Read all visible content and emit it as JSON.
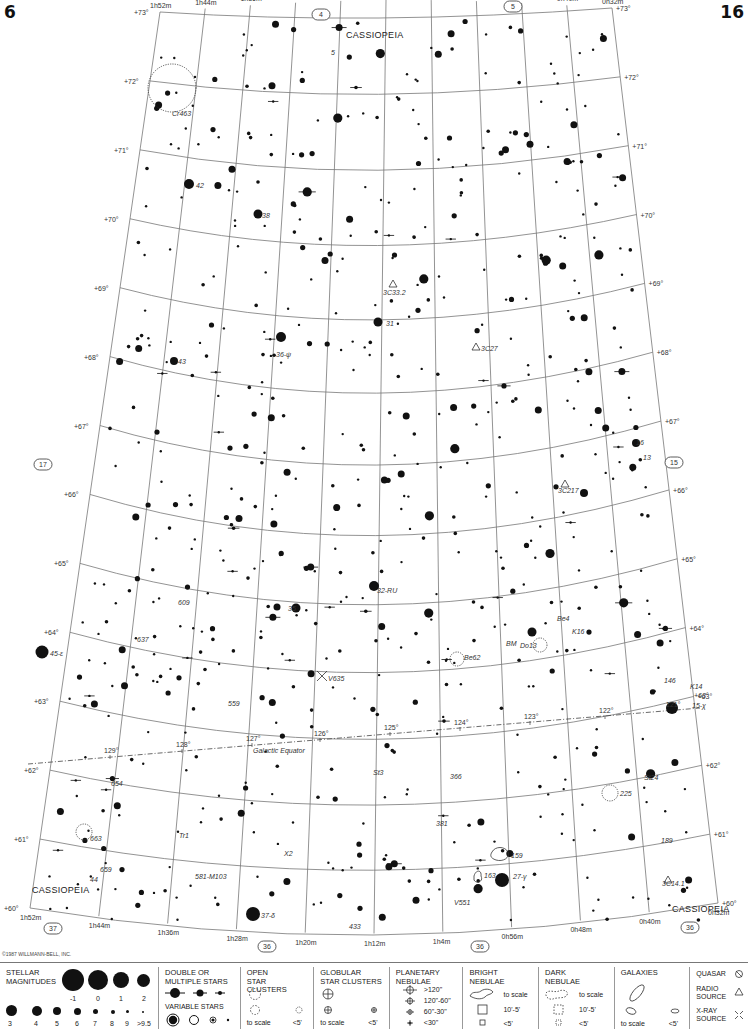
{
  "page": {
    "left_number": "6",
    "right_number": "16"
  },
  "constellation_labels": [
    {
      "text": "CASSIOPEIA",
      "x": 346,
      "y": 38
    },
    {
      "text": "CASSIOPEIA",
      "x": 32,
      "y": 893
    },
    {
      "text": "CASSIOPEIA",
      "x": 672,
      "y": 912
    }
  ],
  "ra_labels_top": [
    "1h52m",
    "1h44m",
    "1h36m",
    "1h28m",
    "1h20m",
    "1h12m",
    "1h4m",
    "0h56m",
    "0h48m",
    "0h40m",
    "0h32m"
  ],
  "ra_labels_bottom": [
    "1h52m",
    "1h44m",
    "1h36m",
    "1h28m",
    "1h20m",
    "1h12m",
    "1h4m",
    "0h56m",
    "0h48m",
    "0h40m",
    "0h32m"
  ],
  "dec_labels": [
    "+73°",
    "+72°",
    "+71°",
    "+70°",
    "+69°",
    "+68°",
    "+67°",
    "+66°",
    "+65°",
    "+64°",
    "+63°",
    "+62°",
    "+61°",
    "+60°"
  ],
  "adjacent_chart_refs": [
    {
      "text": "4",
      "x": 320,
      "y": 10
    },
    {
      "text": "5",
      "x": 512,
      "y": 2
    },
    {
      "text": "17",
      "x": 42,
      "y": 460
    },
    {
      "text": "15",
      "x": 673,
      "y": 458
    },
    {
      "text": "37",
      "x": 52,
      "y": 924
    },
    {
      "text": "36",
      "x": 266,
      "y": 942
    },
    {
      "text": "36",
      "x": 479,
      "y": 942
    },
    {
      "text": "36",
      "x": 689,
      "y": 923
    }
  ],
  "object_labels": [
    {
      "text": "Cr463",
      "x": 172,
      "y": 116
    },
    {
      "text": "5",
      "x": 331,
      "y": 55
    },
    {
      "text": "42",
      "x": 196,
      "y": 188
    },
    {
      "text": "38",
      "x": 262,
      "y": 218
    },
    {
      "text": "3C33.2",
      "x": 383,
      "y": 295
    },
    {
      "text": "3C27",
      "x": 481,
      "y": 351
    },
    {
      "text": "31",
      "x": 386,
      "y": 326
    },
    {
      "text": "36-ψ",
      "x": 276,
      "y": 357
    },
    {
      "text": "43",
      "x": 178,
      "y": 364
    },
    {
      "text": "16",
      "x": 636,
      "y": 445
    },
    {
      "text": "13",
      "x": 643,
      "y": 460
    },
    {
      "text": "3C217",
      "x": 558,
      "y": 493
    },
    {
      "text": "32-RU",
      "x": 377,
      "y": 593
    },
    {
      "text": "35",
      "x": 288,
      "y": 611
    },
    {
      "text": "609",
      "x": 178,
      "y": 605
    },
    {
      "text": "637",
      "x": 137,
      "y": 642
    },
    {
      "text": "Be4",
      "x": 557,
      "y": 621
    },
    {
      "text": "K16",
      "x": 572,
      "y": 634
    },
    {
      "text": "BM",
      "x": 506,
      "y": 646
    },
    {
      "text": "Do13",
      "x": 520,
      "y": 648
    },
    {
      "text": "45-ε",
      "x": 50,
      "y": 656
    },
    {
      "text": "Be62",
      "x": 464,
      "y": 660
    },
    {
      "text": "V635",
      "x": 328,
      "y": 681
    },
    {
      "text": "146",
      "x": 664,
      "y": 683
    },
    {
      "text": "K14",
      "x": 690,
      "y": 689
    },
    {
      "text": "+63°",
      "x": 694,
      "y": 698
    },
    {
      "text": "15-χ",
      "x": 692,
      "y": 708
    },
    {
      "text": "559",
      "x": 228,
      "y": 706
    },
    {
      "text": "Galactic Equator",
      "x": 253,
      "y": 753
    },
    {
      "text": "St3",
      "x": 373,
      "y": 775
    },
    {
      "text": "366",
      "x": 450,
      "y": 779
    },
    {
      "text": "St24",
      "x": 644,
      "y": 780
    },
    {
      "text": "654",
      "x": 111,
      "y": 786
    },
    {
      "text": "225",
      "x": 620,
      "y": 796
    },
    {
      "text": "381",
      "x": 436,
      "y": 826
    },
    {
      "text": "663",
      "x": 90,
      "y": 841
    },
    {
      "text": "Tr1",
      "x": 179,
      "y": 838
    },
    {
      "text": "189",
      "x": 661,
      "y": 843
    },
    {
      "text": "X2",
      "x": 284,
      "y": 856
    },
    {
      "text": "159",
      "x": 511,
      "y": 858
    },
    {
      "text": "163",
      "x": 484,
      "y": 878
    },
    {
      "text": "27-γ",
      "x": 513,
      "y": 879
    },
    {
      "text": "659",
      "x": 100,
      "y": 872
    },
    {
      "text": "44",
      "x": 90,
      "y": 882
    },
    {
      "text": "581-M103",
      "x": 195,
      "y": 879
    },
    {
      "text": "3C14.1",
      "x": 662,
      "y": 886
    },
    {
      "text": "V551",
      "x": 454,
      "y": 905
    },
    {
      "text": "37-δ",
      "x": 261,
      "y": 918
    },
    {
      "text": "433",
      "x": 349,
      "y": 929
    }
  ],
  "galactic_longitude_ticks": [
    "129°",
    "128°",
    "127°",
    "126°",
    "125°",
    "124°",
    "123°",
    "122°",
    "121°"
  ],
  "copyright": "©1987 WILLMANN-BELL, INC.",
  "legend": {
    "stellar_magnitudes": {
      "title_line1": "STELLAR",
      "title_line2": "MAGNITUDES",
      "row1": [
        "-1",
        "0",
        "1",
        "2"
      ],
      "row2": [
        "3",
        "4",
        "5",
        "6",
        "7",
        "8",
        "9",
        ">9.5"
      ]
    },
    "double_stars": {
      "title_line1": "DOUBLE OR",
      "title_line2": "MULTIPLE STARS"
    },
    "variable_stars": {
      "title": "VARIABLE STARS"
    },
    "open_clusters": {
      "title_line1": "OPEN",
      "title_line2": "STAR CLUSTERS",
      "to_scale": "to scale",
      "small": "<5'"
    },
    "globular_clusters": {
      "title_line1": "GLOBULAR",
      "title_line2": "STAR CLUSTERS",
      "to_scale": "to scale",
      "small": "<5'"
    },
    "planetary_nebulae": {
      "title_line1": "PLANETARY",
      "title_line2": "NEBULAE",
      "sizes": [
        ">120\"",
        "120\"-60\"",
        "60\"-30\"",
        "<30\""
      ]
    },
    "bright_nebulae": {
      "title_line1": "BRIGHT",
      "title_line2": "NEBULAE",
      "sizes": [
        "to scale",
        "10'-5'",
        "<5'"
      ]
    },
    "dark_nebulae": {
      "title_line1": "DARK",
      "title_line2": "NEBULAE",
      "sizes": [
        "to scale",
        "10'-5'",
        "<5'"
      ]
    },
    "galaxies": {
      "title": "GALAXIES",
      "to_scale": "to scale",
      "small": "<5'"
    },
    "other": {
      "quasar": "QUASAR",
      "radio_line1": "RADIO",
      "radio_line2": "SOURCE",
      "xray_line1": "X-RAY",
      "xray_line2": "SOURCE"
    }
  }
}
